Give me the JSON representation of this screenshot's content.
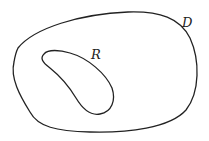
{
  "diagram": {
    "regions": [
      {
        "id": "outer",
        "label": "D"
      },
      {
        "id": "inner",
        "label": "R"
      }
    ],
    "stroke_color": "#222222",
    "background": "#ffffff"
  }
}
